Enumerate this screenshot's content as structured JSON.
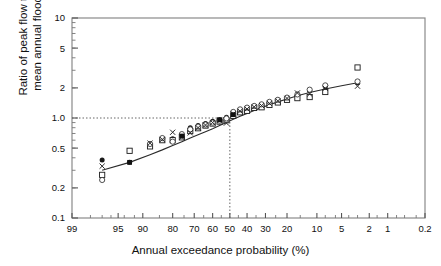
{
  "chart_data": {
    "type": "scatter",
    "title": "",
    "xlabel": "Annual exceedance probability (%)",
    "ylabel": "Ratio of peak flow to mean annual flood",
    "ylabel_line1": "Ratio of peak flow to",
    "ylabel_line2": "mean annual flood",
    "x_scale": "normal-probability",
    "y_scale": "log",
    "xlim": [
      99,
      0.2
    ],
    "ylim": [
      0.1,
      10
    ],
    "grid": false,
    "legend": false,
    "xticks": [
      99,
      95,
      90,
      80,
      70,
      60,
      50,
      40,
      30,
      20,
      10,
      5,
      2,
      1,
      0.2
    ],
    "xticklabels": [
      "99",
      "95",
      "90",
      "80",
      "70",
      "60",
      "50",
      "40",
      "30",
      "20",
      "10",
      "5",
      "2",
      "1",
      "0.2"
    ],
    "yticks": [
      10,
      5,
      2,
      1.0,
      0.5,
      0.2,
      0.1
    ],
    "yticklabels": [
      "10",
      "5",
      "2",
      "1.0",
      "0.5",
      "0.2",
      "0.1"
    ],
    "annotations": [
      {
        "name": "horizontal-reference-line",
        "type": "hline",
        "y": 1.0,
        "style": "dotted",
        "x_from": 99,
        "x_to": 50
      },
      {
        "name": "vertical-reference-line",
        "type": "vline",
        "x": 50,
        "style": "dotted",
        "y_from": 0.1,
        "y_to": 1.0
      }
    ],
    "fit_line": {
      "name": "fitted-curve",
      "x": [
        97,
        93,
        88,
        84,
        80,
        76,
        72,
        68,
        64,
        60,
        56,
        52,
        48,
        44,
        40,
        36,
        32,
        28,
        24,
        20,
        16,
        12,
        8,
        5,
        3
      ],
      "y": [
        0.3,
        0.36,
        0.43,
        0.48,
        0.53,
        0.58,
        0.63,
        0.68,
        0.73,
        0.78,
        0.84,
        0.9,
        0.97,
        1.04,
        1.11,
        1.19,
        1.27,
        1.36,
        1.45,
        1.55,
        1.67,
        1.8,
        1.95,
        2.1,
        2.25
      ]
    },
    "series": [
      {
        "name": "filled-circle-series",
        "marker": "filled-circle",
        "color": "#1a1a1a",
        "x": [
          97,
          93,
          88,
          84,
          80,
          76,
          72,
          68,
          64,
          60,
          56,
          52,
          48,
          44,
          40,
          36,
          32,
          28,
          24,
          20,
          16,
          12,
          8,
          3
        ],
        "y": [
          0.38,
          0.36,
          0.52,
          0.62,
          0.62,
          0.66,
          0.8,
          0.84,
          0.88,
          0.93,
          0.96,
          1.02,
          1.12,
          1.2,
          1.24,
          1.3,
          1.34,
          1.42,
          1.5,
          1.58,
          1.7,
          1.88,
          2.05,
          2.25
        ]
      },
      {
        "name": "open-square-series",
        "marker": "open-square",
        "color": "#1a1a1a",
        "x": [
          97,
          93,
          88,
          84,
          80,
          76,
          72,
          68,
          64,
          60,
          56,
          52,
          48,
          44,
          40,
          36,
          32,
          28,
          24,
          20,
          16,
          12,
          8,
          3
        ],
        "y": [
          0.27,
          0.47,
          0.52,
          0.6,
          0.6,
          0.64,
          0.74,
          0.79,
          0.84,
          0.88,
          0.92,
          0.95,
          1.05,
          1.14,
          1.18,
          1.26,
          1.28,
          1.35,
          1.43,
          1.52,
          1.58,
          1.62,
          1.82,
          3.2
        ]
      },
      {
        "name": "open-circle-series",
        "marker": "open-circle",
        "color": "#3a3a3a",
        "x": [
          97,
          88,
          84,
          80,
          76,
          72,
          68,
          64,
          60,
          56,
          52,
          48,
          44,
          40,
          36,
          32,
          28,
          24,
          20,
          16,
          12,
          8,
          3
        ],
        "y": [
          0.24,
          0.55,
          0.63,
          0.58,
          0.69,
          0.77,
          0.82,
          0.86,
          0.9,
          0.94,
          0.99,
          1.15,
          1.22,
          1.27,
          1.32,
          1.37,
          1.45,
          1.52,
          1.6,
          1.72,
          1.92,
          2.12,
          2.32
        ]
      },
      {
        "name": "cross-x-series",
        "marker": "x-cross",
        "color": "#2a2a2a",
        "x": [
          97,
          88,
          84,
          80,
          76,
          72,
          68,
          64,
          60,
          56,
          52,
          48,
          44,
          40,
          36,
          32,
          28,
          24,
          20,
          16,
          12,
          8,
          3
        ],
        "y": [
          0.33,
          0.56,
          0.61,
          0.72,
          0.64,
          0.71,
          0.8,
          0.85,
          0.9,
          0.95,
          0.89,
          1.1,
          1.17,
          1.23,
          1.29,
          1.33,
          1.4,
          1.48,
          1.57,
          1.78,
          1.74,
          1.98,
          2.08
        ]
      },
      {
        "name": "filled-square-series",
        "marker": "filled-square",
        "color": "#111111",
        "x": [
          93,
          76,
          56,
          48
        ],
        "y": [
          0.36,
          0.66,
          0.96,
          1.08
        ]
      }
    ]
  }
}
